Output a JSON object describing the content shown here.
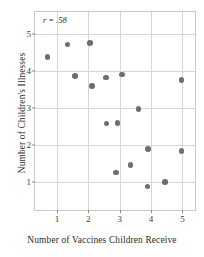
{
  "chart_data": {
    "type": "scatter",
    "title": "",
    "xlabel": "Number of Vaccines Children Receive",
    "ylabel": "Number of Children's Illnesses",
    "annotation": "r = .58",
    "xlim": [
      0.3,
      5.4
    ],
    "ylim": [
      0.25,
      5.6
    ],
    "xticks": [
      1,
      2,
      3,
      4,
      5
    ],
    "yticks": [
      1,
      2,
      3,
      4,
      5
    ],
    "xtick_labels": [
      "1",
      "2",
      "3",
      "4",
      "5"
    ],
    "ytick_labels": [
      "1",
      "2",
      "3",
      "4",
      "5"
    ],
    "grid": true,
    "legend": "none",
    "marker": {
      "shape": "circle",
      "color": "#6e6e6e",
      "size": 5.6
    },
    "points": [
      {
        "x": 0.7,
        "y": 4.38
      },
      {
        "x": 1.33,
        "y": 4.72
      },
      {
        "x": 1.57,
        "y": 3.87
      },
      {
        "x": 2.06,
        "y": 4.77
      },
      {
        "x": 2.11,
        "y": 3.6
      },
      {
        "x": 2.56,
        "y": 3.83
      },
      {
        "x": 2.58,
        "y": 2.59
      },
      {
        "x": 2.88,
        "y": 1.26
      },
      {
        "x": 2.93,
        "y": 2.6
      },
      {
        "x": 3.07,
        "y": 3.91
      },
      {
        "x": 3.35,
        "y": 1.46
      },
      {
        "x": 3.6,
        "y": 2.98
      },
      {
        "x": 3.89,
        "y": 0.88
      },
      {
        "x": 3.91,
        "y": 1.9
      },
      {
        "x": 4.44,
        "y": 1.01
      },
      {
        "x": 4.97,
        "y": 1.84
      },
      {
        "x": 4.97,
        "y": 3.76
      }
    ]
  }
}
